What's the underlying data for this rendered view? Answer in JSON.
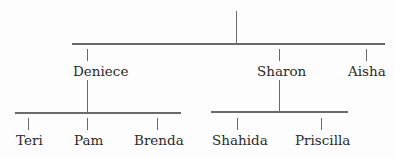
{
  "tree": {
    "generation1": {
      "children": [
        "Deniece",
        "Sharon",
        "Aisha"
      ]
    },
    "generation2": [
      {
        "parent": "Deniece",
        "children": [
          "Teri",
          "Pam",
          "Brenda"
        ]
      },
      {
        "parent": "Sharon",
        "children": [
          "Shahida",
          "Priscilla"
        ]
      }
    ]
  },
  "names": {
    "deniece": "Deniece",
    "sharon": "Sharon",
    "aisha": "Aisha",
    "teri": "Teri",
    "pam": "Pam",
    "brenda": "Brenda",
    "shahida": "Shahida",
    "priscilla": "Priscilla"
  },
  "colors": {
    "line": "#6a6a6a",
    "text": "#2a2a2a"
  }
}
